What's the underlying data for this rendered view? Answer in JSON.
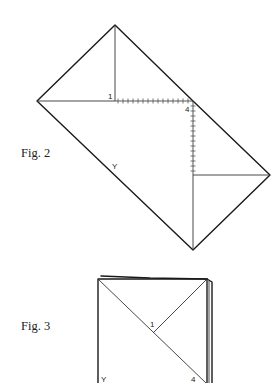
{
  "figures": [
    {
      "id": "fig2",
      "caption": "Fig. 2",
      "labels": {
        "p1": "1",
        "p4": "4",
        "p3": "3",
        "y": "Y"
      },
      "shape": "diamond folded rectangle with hatched fold lines"
    },
    {
      "id": "fig3",
      "caption": "Fig. 3",
      "labels": {
        "p1": "1",
        "y": "Y",
        "p4": "4"
      },
      "shape": "folded square with diagonal creases"
    }
  ],
  "colors": {
    "line": "#1a1a1a",
    "background": "#ffffff"
  }
}
